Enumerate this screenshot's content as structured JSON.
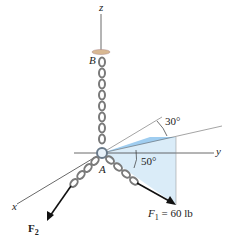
{
  "figure": {
    "axes": {
      "x": "x",
      "y": "y",
      "z": "z"
    },
    "points": {
      "A": "A",
      "B": "B"
    },
    "angles": {
      "azimuth": "30°",
      "elevation": "50°"
    },
    "forces": {
      "F1": {
        "symbol": "F",
        "subscript": "1",
        "value": " = 60 lb"
      },
      "F2": {
        "symbol": "F",
        "subscript": "2"
      }
    },
    "colors": {
      "plane_fill": "#cfe6f5",
      "triangle_fill": "#9fd0f0",
      "chain": "#8a8a8a",
      "axis": "#444444",
      "arrow": "#111111"
    }
  }
}
